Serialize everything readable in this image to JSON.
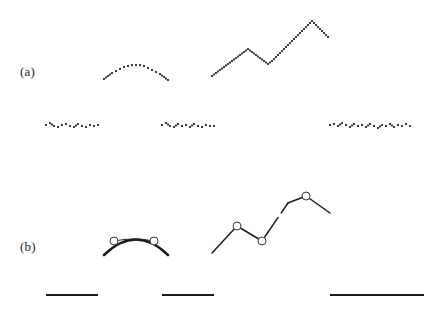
{
  "figure": {
    "title": "",
    "background_color": "#ffffff",
    "ink_color": "#1b1b1b",
    "width": 434,
    "height": 309
  },
  "panels": [
    {
      "id": "a",
      "label": "(a)",
      "label_x": 20,
      "label_y": 64,
      "render_style": "dotted-scatter",
      "description": "raw sampled data shown as dense dot trails"
    },
    {
      "id": "b",
      "label": "(b)",
      "label_x": 20,
      "label_y": 239,
      "render_style": "solid-polyline-with-vertex-markers",
      "description": "fitted piecewise curves with open circle vertex markers"
    }
  ],
  "chart_data": {
    "type": "scatter",
    "title": "",
    "xlabel": "",
    "ylabel": "",
    "xlim": [
      0,
      434
    ],
    "ylim": [
      309,
      0
    ],
    "grid": false,
    "legend": null,
    "annotations": [
      {
        "text": "(a)",
        "x": 20,
        "y": 64
      },
      {
        "text": "(b)",
        "x": 20,
        "y": 239
      }
    ],
    "panel_a": {
      "type": "scatter",
      "marker": "square-dot",
      "marker_size": 1.6,
      "color": "#1b1b1b",
      "series": [
        {
          "name": "group-1-upper-arc",
          "present": false,
          "points": []
        },
        {
          "name": "group-1-baseline-trail",
          "x": [
            46,
            50,
            54,
            58,
            62,
            66,
            70,
            74,
            78,
            82,
            86,
            90,
            94,
            98
          ],
          "y": [
            125,
            123,
            126,
            127,
            125,
            124,
            126,
            127,
            124,
            126,
            127,
            125,
            126,
            125
          ]
        },
        {
          "name": "group-2-upper-arc",
          "x": [
            104,
            108,
            112,
            116,
            120,
            124,
            128,
            132,
            136,
            140,
            144,
            148,
            152,
            156,
            160,
            164,
            168
          ],
          "y": [
            79,
            76,
            73,
            71,
            69,
            67,
            66,
            65,
            65,
            65,
            66,
            68,
            70,
            72,
            74,
            77,
            80
          ]
        },
        {
          "name": "group-2-baseline-trail",
          "x": [
            162,
            166,
            170,
            174,
            178,
            182,
            186,
            190,
            194,
            198,
            202,
            206,
            210,
            214
          ],
          "y": [
            125,
            123,
            126,
            127,
            124,
            126,
            125,
            127,
            124,
            126,
            127,
            125,
            126,
            126
          ]
        },
        {
          "name": "group-3-zigzag",
          "x": [
            212,
            216,
            220,
            224,
            228,
            232,
            236,
            240,
            244,
            248,
            252,
            256,
            260,
            264,
            268,
            272,
            276,
            280,
            284,
            288,
            292,
            296,
            300,
            304,
            308,
            312,
            316,
            320,
            324,
            328
          ],
          "y": [
            76,
            73,
            70,
            67,
            64,
            61,
            58,
            55,
            52,
            49,
            52,
            55,
            58,
            61,
            64,
            61,
            57,
            53,
            49,
            45,
            41,
            37,
            33,
            29,
            25,
            21,
            25,
            29,
            33,
            37
          ]
        },
        {
          "name": "group-3-baseline-trail",
          "x": [
            330,
            334,
            338,
            342,
            346,
            350,
            354,
            358,
            362,
            366,
            370,
            374,
            378,
            382,
            386,
            390,
            394,
            398,
            402,
            406,
            410
          ],
          "y": [
            125,
            124,
            126,
            123,
            125,
            127,
            124,
            126,
            125,
            127,
            124,
            126,
            128,
            125,
            126,
            124,
            127,
            125,
            126,
            124,
            126
          ]
        }
      ]
    },
    "panel_b": {
      "type": "line",
      "marker": "open-circle",
      "marker_size": 4,
      "line_color": "#1b1b1b",
      "series": [
        {
          "name": "group-1-baseline-rule",
          "x": [
            46,
            98
          ],
          "y": [
            295,
            295
          ]
        },
        {
          "name": "group-2-arc-thick",
          "x": [
            104,
            136,
            168
          ],
          "y": [
            255,
            238,
            255
          ]
        },
        {
          "name": "group-2-chord-thin",
          "x": [
            114,
            154
          ],
          "y": [
            241,
            241
          ]
        },
        {
          "name": "group-2-baseline-rule",
          "x": [
            162,
            214
          ],
          "y": [
            295,
            295
          ]
        },
        {
          "name": "group-3-polyline",
          "x": [
            212,
            237,
            262,
            288,
            306,
            330
          ],
          "y": [
            253,
            226,
            241,
            203,
            196,
            213
          ]
        },
        {
          "name": "group-3-baseline-rule",
          "x": [
            330,
            424
          ],
          "y": [
            295,
            295
          ]
        }
      ],
      "vertex_markers": [
        {
          "x": 114,
          "y": 241
        },
        {
          "x": 154,
          "y": 241
        },
        {
          "x": 237,
          "y": 226
        },
        {
          "x": 262,
          "y": 241
        },
        {
          "x": 306,
          "y": 196
        }
      ]
    }
  }
}
